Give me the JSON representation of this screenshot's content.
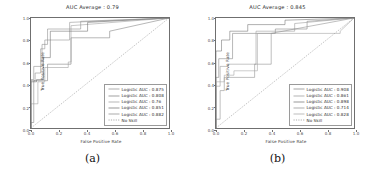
{
  "figure": {
    "panels": [
      {
        "caption": "(a)",
        "title": "AUC Average : 0.79",
        "xlabel": "False Positive Rate",
        "ylabel": "True Positive Rate",
        "xticks": [
          "0.0",
          "0.2",
          "0.4",
          "0.6",
          "0.8",
          "1.0"
        ],
        "yticks": [
          "0.0",
          "0.2",
          "0.4",
          "0.6",
          "0.8",
          "1.0"
        ],
        "legend": [
          {
            "label": "Logistic AUC : 0.875",
            "color": "#8c8c8c",
            "dash": "none"
          },
          {
            "label": "Logistic AUC : 0.808",
            "color": "#7a7a7a",
            "dash": "none"
          },
          {
            "label": "Logistic AUC : 0.76",
            "color": "#9a9a9a",
            "dash": "none"
          },
          {
            "label": "Logistic AUC : 0.851",
            "color": "#6b6b6b",
            "dash": "none"
          },
          {
            "label": "Logistic AUC : 0.882",
            "color": "#888888",
            "dash": "none"
          },
          {
            "label": "No Skill",
            "color": "#8a8a8a",
            "dash": "1.2,1.2"
          }
        ]
      },
      {
        "caption": "(b)",
        "title": "AUC Average : 0.845",
        "xlabel": "False Positive Rate",
        "ylabel": "True Positive Rate",
        "xticks": [
          "0.0",
          "0.2",
          "0.4",
          "0.6",
          "0.8",
          "1.0"
        ],
        "yticks": [
          "0.0",
          "0.2",
          "0.4",
          "0.6",
          "0.8",
          "1.0"
        ],
        "legend": [
          {
            "label": "Logistic AUC : 0.908",
            "color": "#7f7f7f",
            "dash": "none"
          },
          {
            "label": "Logistic AUC : 0.861",
            "color": "#949494",
            "dash": "none"
          },
          {
            "label": "Logistic AUC : 0.898",
            "color": "#6e6e6e",
            "dash": "none"
          },
          {
            "label": "Logistic AUC : 0.714",
            "color": "#8a8a8a",
            "dash": "none"
          },
          {
            "label": "Logistic AUC : 0.828",
            "color": "#a0a0a0",
            "dash": "none"
          },
          {
            "label": "No Skill",
            "color": "#8a8a8a",
            "dash": "1.2,1.2"
          }
        ]
      }
    ]
  },
  "chart_data": [
    {
      "type": "line",
      "title": "AUC Average : 0.79",
      "subtitle": "(a)",
      "xlabel": "False Positive Rate",
      "ylabel": "True Positive Rate",
      "xlim": [
        0.0,
        1.0
      ],
      "ylim": [
        0.0,
        1.0
      ],
      "xticks": [
        0.0,
        0.2,
        0.4,
        0.6,
        0.8,
        1.0
      ],
      "yticks": [
        0.0,
        0.2,
        0.4,
        0.6,
        0.8,
        1.0
      ],
      "grid": false,
      "legend_position": "lower right",
      "auc_average": 0.79,
      "series": [
        {
          "name": "Logistic AUC : 0.875",
          "auc": 0.875,
          "style": "step",
          "x": [
            0.0,
            0.0,
            0.03,
            0.03,
            0.07,
            0.07,
            0.1,
            0.1,
            0.28,
            0.28,
            1.0
          ],
          "y": [
            0.0,
            0.43,
            0.43,
            0.5,
            0.5,
            0.72,
            0.72,
            0.8,
            0.8,
            0.96,
            1.0
          ]
        },
        {
          "name": "Logistic AUC : 0.808",
          "auc": 0.808,
          "style": "step",
          "x": [
            0.0,
            0.0,
            0.02,
            0.02,
            0.12,
            0.12,
            0.29,
            0.29,
            0.57,
            0.57,
            1.0
          ],
          "y": [
            0.0,
            0.05,
            0.05,
            0.43,
            0.43,
            0.58,
            0.58,
            0.82,
            0.82,
            0.88,
            1.0
          ]
        },
        {
          "name": "Logistic AUC : 0.76",
          "auc": 0.76,
          "style": "step",
          "x": [
            0.0,
            0.0,
            0.05,
            0.05,
            0.1,
            0.1,
            0.27,
            0.27,
            0.29,
            0.29,
            1.0
          ],
          "y": [
            0.0,
            0.22,
            0.22,
            0.42,
            0.42,
            0.55,
            0.55,
            0.6,
            0.6,
            0.93,
            1.0
          ]
        },
        {
          "name": "Logistic AUC : 0.851",
          "auc": 0.851,
          "style": "step",
          "x": [
            0.0,
            0.0,
            0.04,
            0.04,
            0.09,
            0.09,
            0.14,
            0.14,
            0.41,
            0.41,
            1.0
          ],
          "y": [
            0.0,
            0.42,
            0.42,
            0.44,
            0.44,
            0.64,
            0.64,
            0.88,
            0.88,
            0.96,
            1.0
          ]
        },
        {
          "name": "Logistic AUC : 0.882",
          "auc": 0.882,
          "style": "step",
          "x": [
            0.0,
            0.0,
            0.02,
            0.02,
            0.08,
            0.08,
            0.12,
            0.12,
            0.36,
            0.36,
            1.0
          ],
          "y": [
            0.0,
            0.44,
            0.44,
            0.56,
            0.56,
            0.76,
            0.76,
            0.9,
            0.9,
            0.97,
            1.0
          ]
        },
        {
          "name": "No Skill",
          "style": "dashed-diagonal",
          "x": [
            0.0,
            1.0
          ],
          "y": [
            0.0,
            1.0
          ]
        }
      ]
    },
    {
      "type": "line",
      "title": "AUC Average : 0.845",
      "subtitle": "(b)",
      "xlabel": "False Positive Rate",
      "ylabel": "True Positive Rate",
      "xlim": [
        0.0,
        1.0
      ],
      "ylim": [
        0.0,
        1.0
      ],
      "xticks": [
        0.0,
        0.2,
        0.4,
        0.6,
        0.8,
        1.0
      ],
      "yticks": [
        0.0,
        0.2,
        0.4,
        0.6,
        0.8,
        1.0
      ],
      "grid": false,
      "legend_position": "lower right",
      "auc_average": 0.845,
      "series": [
        {
          "name": "Logistic AUC : 0.908",
          "auc": 0.908,
          "style": "step",
          "x": [
            0.0,
            0.0,
            0.02,
            0.02,
            0.12,
            0.12,
            0.43,
            0.43,
            0.66,
            0.66,
            1.0
          ],
          "y": [
            0.0,
            0.46,
            0.46,
            0.63,
            0.63,
            0.86,
            0.86,
            0.9,
            0.9,
            0.97,
            1.0
          ]
        },
        {
          "name": "Logistic AUC : 0.861",
          "auc": 0.861,
          "style": "step",
          "x": [
            0.0,
            0.0,
            0.03,
            0.03,
            0.09,
            0.09,
            0.29,
            0.29,
            0.57,
            0.57,
            1.0
          ],
          "y": [
            0.0,
            0.38,
            0.38,
            0.56,
            0.56,
            0.58,
            0.58,
            0.88,
            0.88,
            0.95,
            1.0
          ]
        },
        {
          "name": "Logistic AUC : 0.898",
          "auc": 0.898,
          "style": "step",
          "x": [
            0.0,
            0.0,
            0.04,
            0.04,
            0.1,
            0.1,
            0.23,
            0.23,
            0.5,
            0.5,
            1.0
          ],
          "y": [
            0.0,
            0.7,
            0.7,
            0.8,
            0.8,
            0.88,
            0.88,
            0.94,
            0.94,
            0.98,
            1.0
          ]
        },
        {
          "name": "Logistic AUC : 0.714",
          "auc": 0.714,
          "style": "step",
          "x": [
            0.0,
            0.0,
            0.03,
            0.03,
            0.06,
            0.06,
            0.28,
            0.28,
            0.4,
            0.4,
            1.0
          ],
          "y": [
            0.0,
            0.08,
            0.08,
            0.34,
            0.34,
            0.46,
            0.46,
            0.58,
            0.58,
            0.86,
            1.0
          ]
        },
        {
          "name": "Logistic AUC : 0.828",
          "auc": 0.828,
          "style": "step",
          "x": [
            0.0,
            0.0,
            0.06,
            0.06,
            0.13,
            0.13,
            0.3,
            0.3,
            0.9,
            0.9,
            1.0
          ],
          "y": [
            0.0,
            0.42,
            0.42,
            0.48,
            0.48,
            0.52,
            0.52,
            0.86,
            0.86,
            0.88,
            1.0
          ]
        },
        {
          "name": "No Skill",
          "style": "dashed-diagonal",
          "x": [
            0.0,
            1.0
          ],
          "y": [
            0.0,
            1.0
          ]
        }
      ]
    }
  ]
}
